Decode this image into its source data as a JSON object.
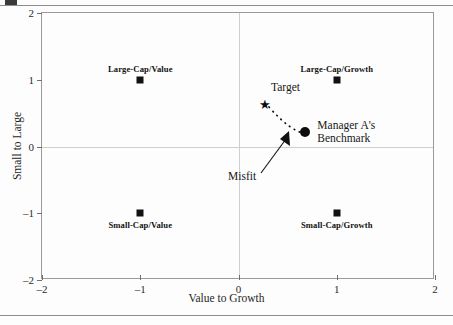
{
  "chart_data": {
    "type": "scatter",
    "title": "",
    "xlabel": "Value to Growth",
    "ylabel": "Small to Large",
    "xlim": [
      -2,
      2
    ],
    "ylim": [
      -2,
      2
    ],
    "xticks": [
      "-2",
      "-1",
      "0",
      "1",
      "2"
    ],
    "xtick_values": [
      -2,
      -1,
      0,
      1,
      2
    ],
    "yticks": [
      "2",
      "1",
      "0",
      "-1",
      "-2"
    ],
    "ytick_values": [
      2,
      1,
      0,
      -1,
      -2
    ],
    "grid": false,
    "zero_axes": true,
    "legend": "none",
    "points": [
      {
        "name": "Large-Cap/Value",
        "x": -1,
        "y": 1,
        "marker": "square",
        "label": "Large-Cap/Value",
        "label_pos": "above"
      },
      {
        "name": "Large-Cap/Growth",
        "x": 1,
        "y": 1,
        "marker": "square",
        "label": "Large-Cap/Growth",
        "label_pos": "above"
      },
      {
        "name": "Small-Cap/Value",
        "x": -1,
        "y": -1,
        "marker": "square",
        "label": "Small-Cap/Value",
        "label_pos": "below"
      },
      {
        "name": "Small-Cap/Growth",
        "x": 1,
        "y": -1,
        "marker": "square",
        "label": "Small-Cap/Growth",
        "label_pos": "below"
      },
      {
        "name": "Target",
        "x": 0.27,
        "y": 0.63,
        "marker": "star",
        "label": "Target",
        "label_pos": "above"
      },
      {
        "name": "Manager A's Benchmark",
        "x": 0.68,
        "y": 0.22,
        "marker": "circle",
        "label": "Manager A's Benchmark",
        "label_pos": "right"
      }
    ],
    "annotations": [
      {
        "name": "target-label",
        "text": "Target"
      },
      {
        "name": "benchmark-label",
        "text_line1": "Manager A's",
        "text_line2": "Benchmark"
      },
      {
        "name": "misfit-label",
        "text": "Misfit",
        "description": "arrow pointing to dotted connector between Target and Manager A's Benchmark"
      }
    ],
    "connector": {
      "name": "misfit-dotted-curve",
      "style": "dotted",
      "from": "Target",
      "to": "Manager A's Benchmark"
    }
  },
  "axes": {
    "x_title": "Value to Growth",
    "y_title": "Small to Large"
  }
}
